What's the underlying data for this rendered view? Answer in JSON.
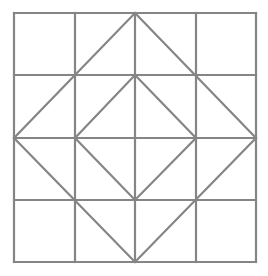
{
  "diagram": {
    "background": "#ffffff",
    "stroke_color": "#858585",
    "stroke_width": 2.2,
    "grid": {
      "rows": 4,
      "cols": 4,
      "x_lines": [
        14,
        75,
        135,
        196,
        256
      ],
      "y_lines": [
        13,
        75,
        138,
        200,
        262
      ]
    },
    "shapes": [
      {
        "name": "outer-diamond",
        "points": [
          [
            135,
            13
          ],
          [
            256,
            138
          ],
          [
            135,
            262
          ],
          [
            14,
            138
          ]
        ]
      },
      {
        "name": "inner-diamond",
        "points": [
          [
            135,
            75
          ],
          [
            196,
            138
          ],
          [
            135,
            200
          ],
          [
            75,
            138
          ]
        ]
      }
    ]
  }
}
